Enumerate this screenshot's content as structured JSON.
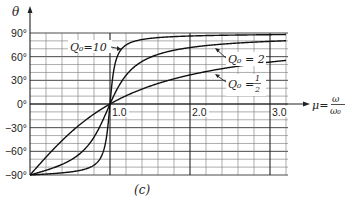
{
  "chart_data": {
    "type": "line",
    "title": "",
    "caption": "(c)",
    "xlabel": "μ = ω/ω₀",
    "ylabel": "θ",
    "xlim": [
      0,
      3.3
    ],
    "ylim": [
      -90,
      90
    ],
    "x_ticks": [
      "1.0",
      "2.0",
      "3.0"
    ],
    "x_tick_values": [
      1.0,
      2.0,
      3.0
    ],
    "y_ticks": [
      "90°",
      "60°",
      "30°",
      "0°",
      "−30°",
      "−60°",
      "−90°"
    ],
    "y_tick_values": [
      90,
      60,
      30,
      0,
      -30,
      -60,
      -90
    ],
    "grid": true,
    "legend_position": "inline annotations",
    "series": [
      {
        "name": "Q0 = 10",
        "label": "Q₀=10",
        "x": [
          0.0,
          0.5,
          0.8,
          0.9,
          0.95,
          1.0,
          1.05,
          1.1,
          1.2,
          1.5,
          2.0,
          3.0
        ],
        "values": [
          -90,
          -86,
          -80,
          -62,
          -44,
          0,
          45,
          62,
          75,
          85,
          87,
          88
        ]
      },
      {
        "name": "Q0 = 2",
        "label": "Q₀ = 2",
        "x": [
          0.0,
          0.3,
          0.5,
          0.8,
          0.9,
          1.0,
          1.2,
          1.5,
          2.0,
          2.5,
          3.0
        ],
        "values": [
          -90,
          -80,
          -72,
          -42,
          -23,
          0,
          36,
          59,
          72,
          76,
          79
        ]
      },
      {
        "name": "Q0 = 1/2",
        "label": "Q₀ = ½",
        "x": [
          0.0,
          0.25,
          0.5,
          0.75,
          1.0,
          1.5,
          2.0,
          2.5,
          3.0
        ],
        "values": [
          -90,
          -62,
          -37,
          -16,
          0,
          23,
          37,
          45,
          53
        ]
      }
    ]
  },
  "labels": {
    "y_axis": "θ",
    "x_axis_mu": "μ=",
    "x_axis_num": "ω",
    "x_axis_den": "ω₀",
    "caption": "(c)",
    "q10": "Q₀=10",
    "q2": "Q₀ = 2",
    "qhalf_prefix": "Q₀ =",
    "qhalf_num": "1",
    "qhalf_den": "2"
  }
}
